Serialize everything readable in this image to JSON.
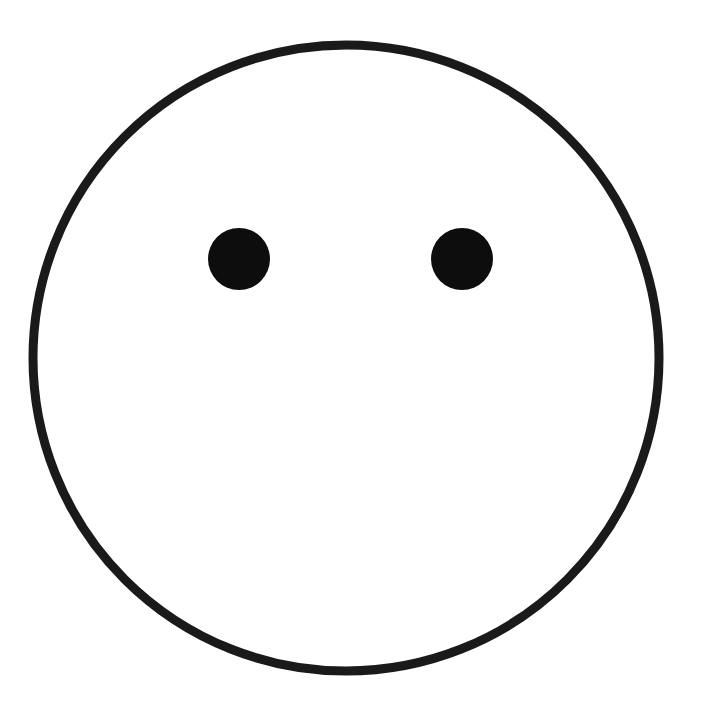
{
  "canvas": {
    "width": 705,
    "height": 718,
    "background_color": "#ffffff"
  },
  "caption": {
    "text": "freak! Don't be afraid to add some color.",
    "color": "#231f20",
    "clipped": "true"
  },
  "drawing": {
    "title": "smiley face outline worksheet",
    "ink_color": "#1a1a1a",
    "face": {
      "shape_name": "face-circle",
      "center_x": 346,
      "center_y": 358,
      "radius": 313,
      "stroke_width": 9,
      "fill": "none",
      "stroke": "#1a1a1a"
    },
    "left_eye": {
      "shape_name": "left-eye",
      "center_x": 239,
      "center_y": 259,
      "radius_x": 31,
      "radius_y": 31,
      "fill": "#0d0d0d"
    },
    "right_eye": {
      "shape_name": "right-eye",
      "center_x": 462,
      "center_y": 259,
      "radius_x": 31,
      "radius_y": 31,
      "fill": "#0d0d0d"
    },
    "mouth": {
      "shape_name": "mouth",
      "present": "false"
    }
  }
}
